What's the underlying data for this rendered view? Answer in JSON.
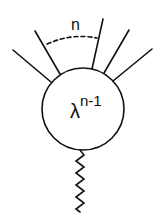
{
  "diagram": {
    "type": "feynman-vertex",
    "vertex_label": {
      "base": "λ",
      "exponent": "n-1"
    },
    "leg_count_label": "n",
    "external_legs": 5,
    "propagator": "wavy",
    "colors": {
      "stroke": "#111111",
      "background": "#ffffff"
    }
  }
}
